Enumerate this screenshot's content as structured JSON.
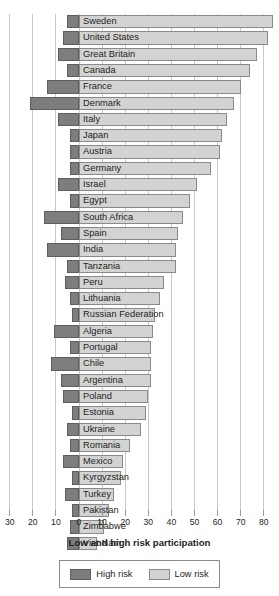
{
  "chart_data": {
    "type": "bar",
    "orientation": "horizontal",
    "stacking": "diverging",
    "title": "",
    "xlabel": "Low and high risk participation",
    "ylabel": "",
    "xlim": [
      -34,
      88
    ],
    "axis_ticks": [
      {
        "label": "30",
        "value": -30
      },
      {
        "label": "20",
        "value": -20
      },
      {
        "label": "10",
        "value": -10
      },
      {
        "label": "0",
        "value": 0
      },
      {
        "label": "10",
        "value": 10
      },
      {
        "label": "20",
        "value": 20
      },
      {
        "label": "30",
        "value": 30
      },
      {
        "label": "40",
        "value": 40
      },
      {
        "label": "50",
        "value": 50
      },
      {
        "label": "60",
        "value": 60
      },
      {
        "label": "70",
        "value": 70
      },
      {
        "label": "80",
        "value": 80
      }
    ],
    "grid": true,
    "legend_position": "bottom",
    "series": [
      {
        "name": "High risk",
        "color": "#7d7d7d",
        "direction": "left"
      },
      {
        "name": "Low risk",
        "color": "#d3d3d3",
        "direction": "right"
      }
    ],
    "categories": [
      "Sweden",
      "United States",
      "Great Britain",
      "Canada",
      "France",
      "Denmark",
      "Italy",
      "Japan",
      "Austria",
      "Germany",
      "Israel",
      "Egypt",
      "South Africa",
      "Spain",
      "India",
      "Tanzania",
      "Peru",
      "Lithuania",
      "Russian Federation",
      "Algeria",
      "Portugal",
      "Chile",
      "Argentina",
      "Poland",
      "Estonia",
      "Ukraine",
      "Romania",
      "Mexico",
      "Kyrgyzstan",
      "Turkey",
      "Pakistan",
      "Zimbabwe",
      "Viet Nam"
    ],
    "rows": [
      {
        "category": "Sweden",
        "high_risk": 5,
        "low_risk": 84
      },
      {
        "category": "United States",
        "high_risk": 7,
        "low_risk": 82
      },
      {
        "category": "Great Britain",
        "high_risk": 9,
        "low_risk": 77
      },
      {
        "category": "Canada",
        "high_risk": 5,
        "low_risk": 74
      },
      {
        "category": "France",
        "high_risk": 14,
        "low_risk": 70
      },
      {
        "category": "Denmark",
        "high_risk": 21,
        "low_risk": 67
      },
      {
        "category": "Italy",
        "high_risk": 9,
        "low_risk": 64
      },
      {
        "category": "Japan",
        "high_risk": 4,
        "low_risk": 62
      },
      {
        "category": "Austria",
        "high_risk": 4,
        "low_risk": 61
      },
      {
        "category": "Germany",
        "high_risk": 4,
        "low_risk": 57
      },
      {
        "category": "Israel",
        "high_risk": 9,
        "low_risk": 51
      },
      {
        "category": "Egypt",
        "high_risk": 4,
        "low_risk": 48
      },
      {
        "category": "South Africa",
        "high_risk": 15,
        "low_risk": 45
      },
      {
        "category": "Spain",
        "high_risk": 8,
        "low_risk": 43
      },
      {
        "category": "India",
        "high_risk": 14,
        "low_risk": 42
      },
      {
        "category": "Tanzania",
        "high_risk": 5,
        "low_risk": 42
      },
      {
        "category": "Peru",
        "high_risk": 6,
        "low_risk": 37
      },
      {
        "category": "Lithuania",
        "high_risk": 4,
        "low_risk": 35
      },
      {
        "category": "Russian Federation",
        "high_risk": 3,
        "low_risk": 33
      },
      {
        "category": "Algeria",
        "high_risk": 11,
        "low_risk": 32
      },
      {
        "category": "Portugal",
        "high_risk": 4,
        "low_risk": 31
      },
      {
        "category": "Chile",
        "high_risk": 12,
        "low_risk": 31
      },
      {
        "category": "Argentina",
        "high_risk": 8,
        "low_risk": 31
      },
      {
        "category": "Poland",
        "high_risk": 7,
        "low_risk": 30
      },
      {
        "category": "Estonia",
        "high_risk": 3,
        "low_risk": 29
      },
      {
        "category": "Ukraine",
        "high_risk": 5,
        "low_risk": 27
      },
      {
        "category": "Romania",
        "high_risk": 4,
        "low_risk": 22
      },
      {
        "category": "Mexico",
        "high_risk": 7,
        "low_risk": 19
      },
      {
        "category": "Kyrgyzstan",
        "high_risk": 3,
        "low_risk": 18
      },
      {
        "category": "Turkey",
        "high_risk": 6,
        "low_risk": 15
      },
      {
        "category": "Pakistan",
        "high_risk": 3,
        "low_risk": 13
      },
      {
        "category": "Zimbabwe",
        "high_risk": 4,
        "low_risk": 11
      },
      {
        "category": "Viet Nam",
        "high_risk": 5,
        "low_risk": 8
      }
    ]
  },
  "legend": {
    "items": [
      {
        "label": "High risk",
        "swatch": "high"
      },
      {
        "label": "Low risk",
        "swatch": "low"
      }
    ]
  },
  "colors": {
    "high_risk": "#7d7d7d",
    "low_risk": "#d3d3d3",
    "gridline": "#c9c9c9",
    "text": "#231f20"
  }
}
